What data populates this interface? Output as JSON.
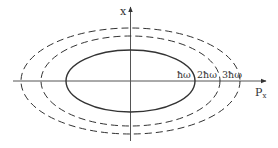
{
  "diagram": {
    "type": "phase-space",
    "axes": {
      "vertical_label": "x",
      "horizontal_label": "P",
      "horizontal_subscript": "x"
    },
    "orbits": [
      {
        "label": "ħω",
        "style": "solid"
      },
      {
        "label": "2ħω",
        "style": "dashed"
      },
      {
        "label": "3ħω",
        "style": "dashed"
      }
    ],
    "colors": {
      "stroke": "#333333",
      "axis": "#555555",
      "background": "#ffffff"
    }
  }
}
